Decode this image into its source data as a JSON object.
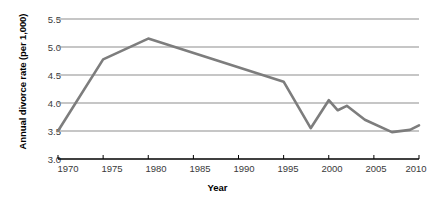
{
  "chart_data": {
    "type": "line",
    "title": "",
    "xlabel": "Year",
    "ylabel": "Annual divorce rate (per 1,000)",
    "xlim": [
      1970,
      2010
    ],
    "ylim": [
      3.0,
      5.5
    ],
    "xticks": [
      "1970",
      "1975",
      "1980",
      "1985",
      "1990",
      "1995",
      "2000",
      "2005",
      "2010"
    ],
    "yticks": [
      "5.5",
      "5.0",
      "4.5",
      "4.0",
      "3.5",
      "3.0"
    ],
    "grid": "horizontal",
    "legend": "none",
    "line_color": "#7d7d7d",
    "axis_color": "#000000",
    "gridline_color": "#8d8d8d",
    "series": [
      {
        "name": "Annual divorce rate (per 1,000)",
        "x": [
          1970,
          1975,
          1980,
          1995,
          1998,
          2000,
          2001,
          2002,
          2004,
          2007,
          2009,
          2010
        ],
        "values": [
          3.5,
          4.78,
          5.15,
          4.38,
          3.55,
          4.05,
          3.87,
          3.95,
          3.7,
          3.48,
          3.52,
          3.6
        ]
      }
    ]
  },
  "axes": {
    "y_title": "Annual divorce rate (per 1,000)",
    "x_title": "Year"
  }
}
